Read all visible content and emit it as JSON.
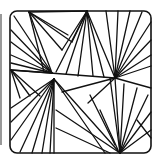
{
  "colors": {
    "ink": "#111111",
    "background": "#ffffff",
    "edge": "#999999"
  },
  "focal_points": {
    "A": [
      29,
      12
    ],
    "B": [
      87,
      11
    ],
    "C": [
      52,
      73
    ],
    "D": [
      115,
      78
    ],
    "E": [
      11,
      70
    ],
    "F": [
      120,
      153
    ],
    "G": [
      54,
      79
    ]
  },
  "lines": [
    [
      29,
      12,
      68,
      35
    ],
    [
      29,
      12,
      72,
      42
    ],
    [
      29,
      12,
      62,
      50
    ],
    [
      29,
      12,
      52,
      73
    ],
    [
      29,
      12,
      44,
      72
    ],
    [
      29,
      12,
      87,
      11
    ],
    [
      87,
      11,
      72,
      42
    ],
    [
      87,
      11,
      62,
      50
    ],
    [
      87,
      11,
      56,
      72
    ],
    [
      87,
      11,
      66,
      74
    ],
    [
      87,
      11,
      78,
      76
    ],
    [
      87,
      11,
      93,
      76
    ],
    [
      87,
      11,
      115,
      78
    ],
    [
      87,
      11,
      104,
      77
    ],
    [
      11,
      30,
      52,
      73
    ],
    [
      11,
      42,
      52,
      73
    ],
    [
      11,
      55,
      52,
      73
    ],
    [
      11,
      63,
      52,
      73
    ],
    [
      14,
      16,
      52,
      73
    ],
    [
      11,
      70,
      52,
      73
    ],
    [
      11,
      70,
      115,
      78
    ],
    [
      11,
      70,
      20,
      98
    ],
    [
      11,
      70,
      30,
      96
    ],
    [
      11,
      70,
      40,
      96
    ],
    [
      54,
      79,
      11,
      122
    ],
    [
      54,
      79,
      11,
      140
    ],
    [
      54,
      79,
      20,
      152
    ],
    [
      54,
      79,
      32,
      153
    ],
    [
      54,
      79,
      42,
      153
    ],
    [
      54,
      79,
      50,
      153
    ],
    [
      54,
      79,
      54,
      153
    ],
    [
      54,
      79,
      11,
      108
    ],
    [
      115,
      78,
      106,
      11
    ],
    [
      115,
      78,
      118,
      11
    ],
    [
      115,
      78,
      130,
      11
    ],
    [
      115,
      78,
      142,
      12
    ],
    [
      115,
      78,
      151,
      22
    ],
    [
      115,
      78,
      151,
      40
    ],
    [
      115,
      78,
      151,
      55
    ],
    [
      115,
      78,
      151,
      66
    ],
    [
      115,
      78,
      151,
      88
    ],
    [
      115,
      78,
      62,
      92
    ],
    [
      115,
      78,
      88,
      103
    ],
    [
      54,
      79,
      120,
      153
    ],
    [
      54,
      79,
      105,
      153
    ],
    [
      56,
      110,
      120,
      153
    ],
    [
      56,
      128,
      110,
      153
    ],
    [
      115,
      78,
      120,
      153
    ],
    [
      110,
      78,
      120,
      153
    ],
    [
      124,
      84,
      120,
      153
    ],
    [
      137,
      88,
      120,
      153
    ],
    [
      148,
      95,
      120,
      153
    ],
    [
      151,
      112,
      120,
      153
    ],
    [
      151,
      130,
      120,
      153
    ],
    [
      137,
      120,
      151,
      138
    ],
    [
      100,
      110,
      118,
      150
    ],
    [
      90,
      95,
      115,
      145
    ]
  ]
}
